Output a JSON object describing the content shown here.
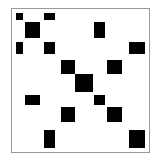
{
  "diagram": {
    "type": "sparse-matrix-block-pattern",
    "frame_color": "#9a9a9a",
    "fill_color": "#000000",
    "background": "#ffffff",
    "columns": [
      {
        "index": 0,
        "x": 16,
        "w": 7
      },
      {
        "index": 1,
        "x": 25,
        "w": 15
      },
      {
        "index": 2,
        "x": 44,
        "w": 11
      },
      {
        "index": 3,
        "x": 61,
        "w": 14
      },
      {
        "index": 4,
        "x": 75,
        "w": 18
      },
      {
        "index": 5,
        "x": 94,
        "w": 11
      },
      {
        "index": 6,
        "x": 107,
        "w": 15
      },
      {
        "index": 7,
        "x": 129,
        "w": 16
      }
    ],
    "rows": [
      {
        "index": 0,
        "y": 13,
        "h": 7
      },
      {
        "index": 1,
        "y": 22,
        "h": 16
      },
      {
        "index": 2,
        "y": 42,
        "h": 12
      },
      {
        "index": 3,
        "y": 60,
        "h": 14
      },
      {
        "index": 4,
        "y": 74,
        "h": 18
      },
      {
        "index": 5,
        "y": 95,
        "h": 10
      },
      {
        "index": 6,
        "y": 107,
        "h": 15
      },
      {
        "index": 7,
        "y": 130,
        "h": 18
      }
    ],
    "nonzeros": [
      [
        0,
        0
      ],
      [
        0,
        2
      ],
      [
        1,
        1
      ],
      [
        1,
        5
      ],
      [
        2,
        0
      ],
      [
        2,
        2
      ],
      [
        2,
        7
      ],
      [
        3,
        3
      ],
      [
        3,
        6
      ],
      [
        4,
        4
      ],
      [
        5,
        1
      ],
      [
        5,
        5
      ],
      [
        6,
        3
      ],
      [
        6,
        6
      ],
      [
        7,
        2
      ],
      [
        7,
        7
      ]
    ]
  }
}
